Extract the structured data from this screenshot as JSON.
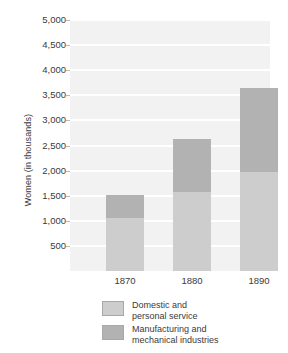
{
  "chart_data": {
    "type": "bar",
    "subtype": "stacked-vertical",
    "title": "",
    "xlabel": "",
    "ylabel": "Women (in thousands)",
    "categories": [
      "1870",
      "1880",
      "1890"
    ],
    "series": [
      {
        "name": "Domestic and personal service",
        "color": "#cdcdcd",
        "values": [
          1055,
          1575,
          1970
        ]
      },
      {
        "name": "Manufacturing and mechanical industries",
        "color": "#b2b2b2",
        "values": [
          460,
          1055,
          1675
        ]
      }
    ],
    "totals": [
      1515,
      2630,
      3645
    ],
    "ylim": [
      0,
      5000
    ],
    "y_tick_step": 500,
    "y_ticks": [
      "500",
      "1,000",
      "1,500",
      "2,000",
      "2,500",
      "3,000",
      "3,500",
      "4,000",
      "4,500",
      "5,000"
    ],
    "y_tick_values": [
      500,
      1000,
      1500,
      2000,
      2500,
      3000,
      3500,
      4000,
      4500,
      5000
    ],
    "grid": true,
    "grid_color": "#ffffff",
    "plot_background": "#f2f2f2",
    "legend_position": "bottom",
    "legend": [
      {
        "label": "Domestic and personal service",
        "line1": "Domestic and",
        "line2": "personal service",
        "color": "#cdcdcd"
      },
      {
        "label": "Manufacturing and mechanical industries",
        "line1": "Manufacturing and",
        "line2": "mechanical industries",
        "color": "#b2b2b2"
      }
    ]
  }
}
